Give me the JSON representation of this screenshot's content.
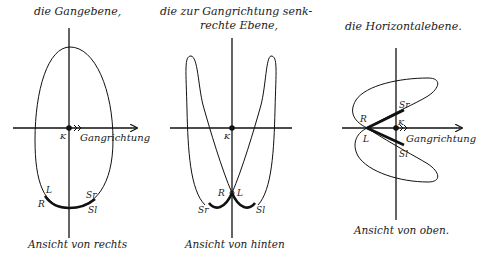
{
  "panels": [
    {
      "id": "gangebene",
      "title": "die Gangebene,",
      "caption": "Ansicht von rechts",
      "axis_label": "Gangrichtung",
      "points": {
        "center": "K",
        "left": "L",
        "right": "R",
        "swing_r": "Sr",
        "swing_l": "Sl"
      }
    },
    {
      "id": "senkrechte-ebene",
      "title_line1": "die zur Gangrichtung senk-",
      "title_line2": "rechte Ebene,",
      "caption": "Ansicht von hinten",
      "points": {
        "center": "K",
        "right": "R",
        "left": "L",
        "swing_r": "Sr",
        "swing_l": "Sl"
      }
    },
    {
      "id": "horizontalebene",
      "title": "die Horizontalebene.",
      "caption": "Ansicht von oben.",
      "axis_label": "Gangrichtung",
      "points": {
        "center": "K",
        "right": "R",
        "left": "L",
        "swing_r": "Sr",
        "swing_l": "Sl"
      }
    }
  ]
}
